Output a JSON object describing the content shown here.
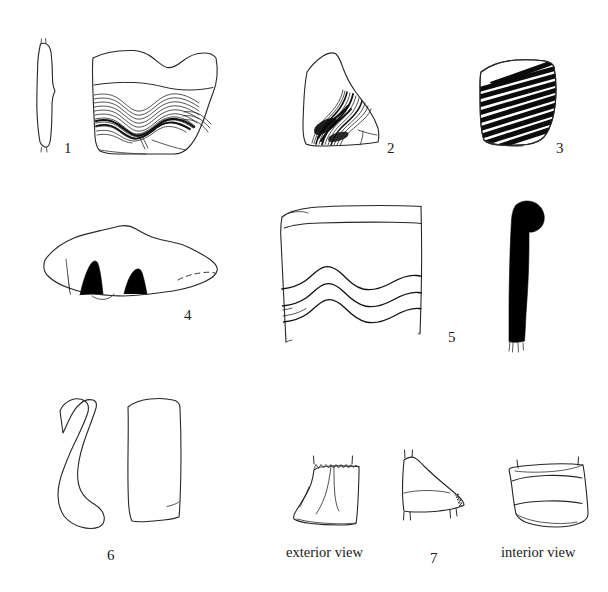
{
  "plate": {
    "title": "Pottery sherd illustration plate",
    "background_color": "#ffffff",
    "ink_color": "#222222",
    "width": 608,
    "height": 592
  },
  "figures": [
    {
      "number": "1",
      "label_x": 64,
      "label_y": 141,
      "description": "Rim sherd with section profile at left and wavy comb-incised decoration",
      "views": [
        "section profile",
        "exterior view"
      ],
      "decoration": "multiple wavy combed incised lines"
    },
    {
      "number": "2",
      "label_x": 387,
      "label_y": 141,
      "description": "Body sherd with dense curving combed incised lines",
      "views": [
        "exterior view"
      ],
      "decoration": "dense curving combed incised bundle"
    },
    {
      "number": "3",
      "label_x": 556,
      "label_y": 141,
      "description": "Body sherd with dense diagonal banded lines",
      "views": [
        "exterior view"
      ],
      "decoration": "close-set diagonal painted bands"
    },
    {
      "number": "4",
      "label_x": 184,
      "label_y": 308,
      "description": "Elongated sherd with thick black inverted-V and arc motifs, dashed reconstruction at right",
      "views": [
        "exterior view"
      ],
      "decoration": "thick black arcs and inverted V strokes"
    },
    {
      "number": "5",
      "label_x": 448,
      "label_y": 330,
      "description": "Rim sherd with horizontal rim band and three wavy incised lines, with solid black rim section at right",
      "views": [
        "exterior view",
        "section profile"
      ],
      "decoration": "horizontal band with three wavy incised lines"
    },
    {
      "number": "6",
      "label_x": 107,
      "label_y": 548,
      "description": "Handle fragment shown in side profile and frontal view",
      "views": [
        "side profile",
        "frontal view"
      ],
      "decoration": "undecorated"
    },
    {
      "number": "7",
      "label_x": 430,
      "label_y": 551,
      "description": "Base or foot fragment shown in three views",
      "views": [
        "exterior view",
        "section profile",
        "interior view"
      ],
      "decoration": "undecorated"
    }
  ],
  "view_labels": [
    {
      "text": "exterior view",
      "x": 286,
      "y": 551
    },
    {
      "text": "interior view",
      "x": 501,
      "y": 551
    }
  ]
}
